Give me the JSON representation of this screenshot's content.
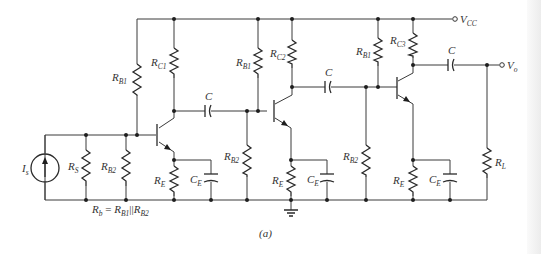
{
  "figure_label": "(a)",
  "supply": {
    "label": "V",
    "sub": "CC"
  },
  "output": {
    "label": "V",
    "sub": "o"
  },
  "source": {
    "label": "I",
    "sub": "s"
  },
  "equation": {
    "lhs": "R",
    "lhs_sub": "b",
    "eq": " = ",
    "r1": "R",
    "r1_sub": "B1",
    "par": "||",
    "r2": "R",
    "r2_sub": "B2"
  },
  "components": {
    "rs": {
      "label": "R",
      "sub": "S"
    },
    "rb2_1": {
      "label": "R",
      "sub": "B2"
    },
    "rb1_1": {
      "label": "R",
      "sub": "B1"
    },
    "rc1": {
      "label": "R",
      "sub": "C1"
    },
    "re_1": {
      "label": "R",
      "sub": "E"
    },
    "ce_1": {
      "label": "C",
      "sub": "E"
    },
    "c_1": {
      "label": "C"
    },
    "rb1_2": {
      "label": "R",
      "sub": "B1"
    },
    "rb2_2": {
      "label": "R",
      "sub": "B2"
    },
    "rc2": {
      "label": "R",
      "sub": "C2"
    },
    "re_2": {
      "label": "R",
      "sub": "E"
    },
    "ce_2": {
      "label": "C",
      "sub": "E"
    },
    "c_2": {
      "label": "C"
    },
    "rb1_3": {
      "label": "R",
      "sub": "B1"
    },
    "rb2_3": {
      "label": "R",
      "sub": "B2"
    },
    "rc3": {
      "label": "R",
      "sub": "C3"
    },
    "re_3": {
      "label": "R",
      "sub": "E"
    },
    "ce_3": {
      "label": "C",
      "sub": "E"
    },
    "c_3": {
      "label": "C"
    },
    "rl": {
      "label": "R",
      "sub": "L"
    }
  }
}
